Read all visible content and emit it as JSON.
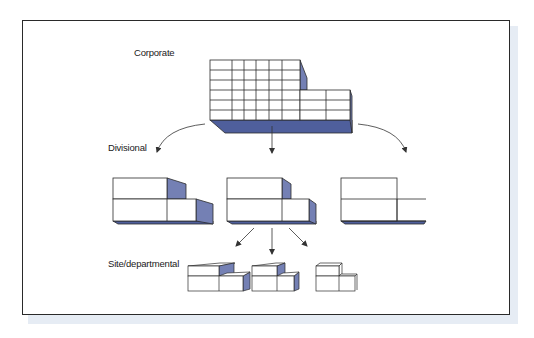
{
  "colors": {
    "frame_border": "#2a2a2a",
    "shadow": "#e6ecf4",
    "block_fill": "#ffffff",
    "block_line": "#2b2b2b",
    "side_shade": "#7480b4",
    "base_shade": "#4f5f9c",
    "arrow": "#333333"
  },
  "labels": {
    "corporate": "Corporate",
    "divisional": "Divisional",
    "site": "Site/departmental"
  },
  "levels": [
    {
      "name": "corporate",
      "blocks": 1,
      "grid_columns": 8,
      "grid_rows": 6
    },
    {
      "name": "divisional",
      "blocks": 3
    },
    {
      "name": "site",
      "blocks": 3
    }
  ]
}
